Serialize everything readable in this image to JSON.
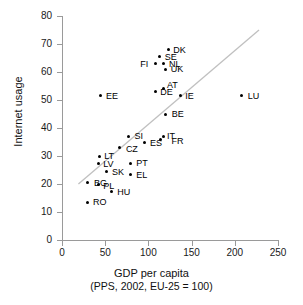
{
  "chart_data": {
    "type": "scatter",
    "title": "",
    "xlabel": "GDP per capita (PPS, 2002, EU-25 = 100)",
    "xlabel_line1": "GDP per capita",
    "xlabel_line2": "(PPS, 2002, EU-25 = 100)",
    "ylabel": "Internet usage",
    "xlim": [
      0,
      250
    ],
    "ylim": [
      0,
      80
    ],
    "xticks": [
      "0",
      "50",
      "100",
      "150",
      "200",
      "250"
    ],
    "yticks": [
      "0",
      "10",
      "20",
      "30",
      "40",
      "50",
      "60",
      "70",
      "80"
    ],
    "xtick_values": [
      0,
      50,
      100,
      150,
      200,
      250
    ],
    "ytick_values": [
      0,
      10,
      20,
      30,
      40,
      50,
      60,
      70,
      80
    ],
    "grid": false,
    "legend": "none",
    "marker_color": "#000000",
    "trendline": {
      "color": "#c0c0c0",
      "x": [
        19,
        228
      ],
      "y": [
        20,
        75
      ]
    },
    "points": [
      {
        "label": "DK",
        "x": 123,
        "y": 68.0,
        "lx": 5,
        "ly": -4
      },
      {
        "label": "SE",
        "x": 113,
        "y": 65.5,
        "lx": 5,
        "ly": -4
      },
      {
        "label": "NL",
        "x": 118,
        "y": 63.0,
        "lx": 5,
        "ly": -4
      },
      {
        "label": "FI",
        "x": 108,
        "y": 63.0,
        "lx": -15,
        "ly": -4
      },
      {
        "label": "UK",
        "x": 120,
        "y": 61.0,
        "lx": 5,
        "ly": -4
      },
      {
        "label": "AT",
        "x": 118,
        "y": 54.0,
        "lx": 3,
        "ly": -8
      },
      {
        "label": "DE",
        "x": 108,
        "y": 53.0,
        "lx": 5,
        "ly": -4
      },
      {
        "label": "IE",
        "x": 137,
        "y": 51.5,
        "lx": 5,
        "ly": -4
      },
      {
        "label": "EE",
        "x": 44,
        "y": 51.5,
        "lx": 6,
        "ly": -4
      },
      {
        "label": "LU",
        "x": 208,
        "y": 51.5,
        "lx": 6,
        "ly": -4
      },
      {
        "label": "BE",
        "x": 120,
        "y": 45.0,
        "lx": 6,
        "ly": -4
      },
      {
        "label": "SI",
        "x": 77,
        "y": 37.0,
        "lx": 6,
        "ly": -4
      },
      {
        "label": "IT",
        "x": 117,
        "y": 37.0,
        "lx": 4,
        "ly": -4
      },
      {
        "label": "FR",
        "x": 114,
        "y": 36.0,
        "lx": 11,
        "ly": -2
      },
      {
        "label": "ES",
        "x": 96,
        "y": 35.0,
        "lx": 5,
        "ly": -3
      },
      {
        "label": "CZ",
        "x": 67,
        "y": 33.0,
        "lx": 6,
        "ly": -3
      },
      {
        "label": "LT",
        "x": 43,
        "y": 30.0,
        "lx": 5,
        "ly": -4
      },
      {
        "label": "LV",
        "x": 42,
        "y": 27.5,
        "lx": 5,
        "ly": -3
      },
      {
        "label": "PT",
        "x": 79,
        "y": 27.5,
        "lx": 6,
        "ly": -4
      },
      {
        "label": "SK",
        "x": 51,
        "y": 24.5,
        "lx": 6,
        "ly": -3
      },
      {
        "label": "EL",
        "x": 79,
        "y": 23.5,
        "lx": 6,
        "ly": -3
      },
      {
        "label": "BG",
        "x": 30,
        "y": 20.5,
        "lx": 6,
        "ly": -4
      },
      {
        "label": "PL",
        "x": 42,
        "y": 20.0,
        "lx": 5,
        "ly": -2
      },
      {
        "label": "HU",
        "x": 57,
        "y": 17.5,
        "lx": 6,
        "ly": -3
      },
      {
        "label": "RO",
        "x": 29,
        "y": 13.5,
        "lx": 6,
        "ly": -4
      }
    ]
  }
}
